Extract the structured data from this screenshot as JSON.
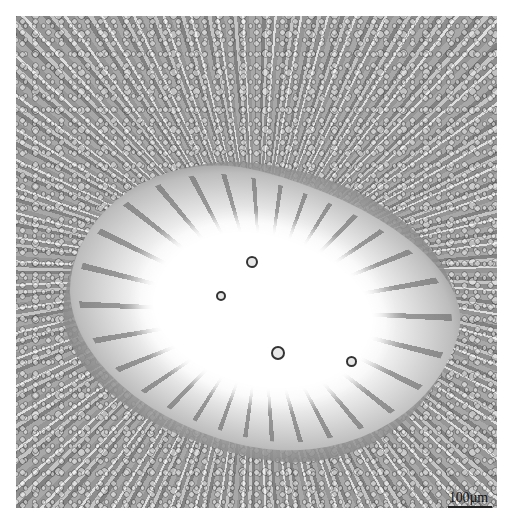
{
  "image": {
    "kind": "light micrograph",
    "subject": "transverse section of radially arranged tissue with central irregular white lumen",
    "colors": {
      "background": "#ffffff",
      "tissue": "#9a9a9a",
      "lumen": "#ffffff",
      "cell_walls": "#333333"
    }
  },
  "scale_bar": {
    "label": "100µm"
  }
}
